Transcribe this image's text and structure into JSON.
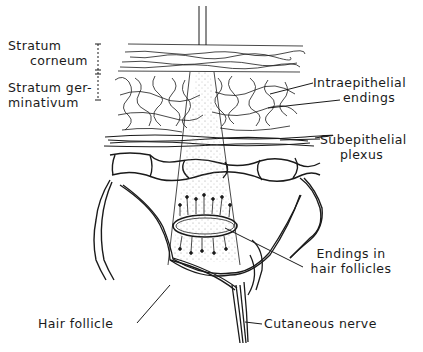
{
  "figure": {
    "type": "anatomical-illustration",
    "colors": {
      "ink": "#1a1a1a",
      "background": "#ffffff",
      "stipple": "#8a8a8a"
    }
  },
  "labels": {
    "stratum_corneum": [
      "Stratum",
      "corneum"
    ],
    "stratum_germinativum": [
      "Stratum ger-",
      "minativum"
    ],
    "intraepithelial_endings": [
      "Intraepithelial",
      "endings"
    ],
    "subepithelial_plexus": [
      "Subepithelial",
      "plexus"
    ],
    "endings_in_hair_follicles": [
      "Endings in",
      "hair follicles"
    ],
    "hair_follicle": "Hair follicle",
    "cutaneous_nerve": "Cutaneous nerve"
  }
}
